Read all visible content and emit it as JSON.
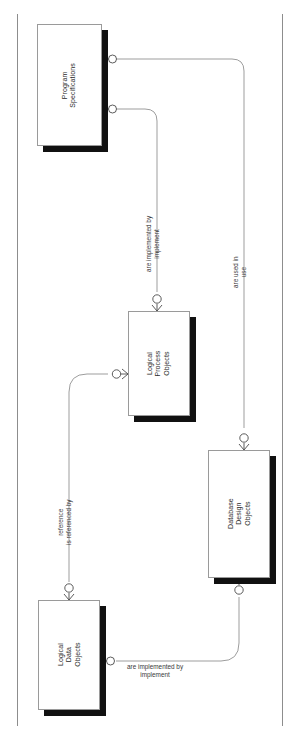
{
  "diagram": {
    "kind": "entity-relationship-diagram",
    "orientation": "rotated-90-landscape-on-portrait-page",
    "background_color": "#ffffff",
    "frame_rule_color": "#8d8d8d",
    "entity_fill": "#ffffff",
    "entity_border_color": "#9a9a9a",
    "entity_shadow_color": "#111111",
    "connector_color": "#9d9d9d",
    "cardinality_marker": "crow-foot-with-circle-zero-or-many",
    "entities": [
      {
        "id": "program-specifications",
        "name": "Program\nSpecifications",
        "name_lines": [
          "Program",
          "Specifications"
        ],
        "x": 37,
        "y": 24,
        "w": 65,
        "h": 122
      },
      {
        "id": "logical-process-objects",
        "name": "Logical\nProcess\nObjects",
        "name_lines": [
          "Logical",
          "Process",
          "Objects"
        ],
        "x": 128,
        "y": 311,
        "w": 62,
        "h": 105
      },
      {
        "id": "database-design-objects",
        "name": "Database\nDesign\nObjects",
        "name_lines": [
          "Database",
          "Design",
          "Objects"
        ],
        "x": 208,
        "y": 450,
        "w": 62,
        "h": 128
      },
      {
        "id": "logical-data-objects",
        "name": "Logical\nData\nObjects",
        "name_lines": [
          "Logical",
          "Data",
          "Objects"
        ],
        "x": 38,
        "y": 600,
        "w": 62,
        "h": 110
      }
    ],
    "relationships": [
      {
        "id": "program-specs-to-logical-process",
        "from": "program-specifications",
        "to": "logical-process-objects",
        "phrase_forward": "are implemented by",
        "phrase_reverse": "implement"
      },
      {
        "id": "program-specs-to-database-design",
        "from": "program-specifications",
        "to": "database-design-objects",
        "phrase_forward": "are used in",
        "phrase_reverse": "use"
      },
      {
        "id": "logical-data-to-logical-process",
        "from": "logical-data-objects",
        "to": "logical-process-objects",
        "phrase_forward": "reference",
        "phrase_reverse": "is referenced by"
      },
      {
        "id": "logical-data-to-database-design",
        "from": "logical-data-objects",
        "to": "database-design-objects",
        "phrase_forward": "are implemented by",
        "phrase_reverse": "implement"
      }
    ]
  }
}
